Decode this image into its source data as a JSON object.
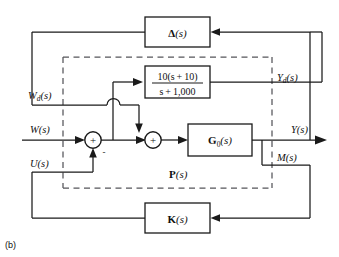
{
  "figure": {
    "caption": "(b)"
  },
  "blocks": [
    {
      "id": "delta",
      "name": "delta-block",
      "label_main": "Δ",
      "label_arg": "(s)"
    },
    {
      "id": "weight",
      "name": "weighting-filter-block",
      "numerator": "10(s + 10)",
      "denominator": "s + 1,000"
    },
    {
      "id": "g0",
      "name": "nominal-plant-block",
      "label_main": "G",
      "label_sub": "0",
      "label_arg": "(s)"
    },
    {
      "id": "k",
      "name": "controller-block",
      "label_main": "K",
      "label_arg": "(s)"
    }
  ],
  "signals": {
    "wd": {
      "base": "W",
      "sub": "d",
      "arg": "(s)"
    },
    "w": {
      "base": "W",
      "sub": "",
      "arg": "(s)"
    },
    "u": {
      "base": "U",
      "sub": "",
      "arg": "(s)"
    },
    "yd": {
      "base": "Y",
      "sub": "d",
      "arg": "(s)"
    },
    "y": {
      "base": "Y",
      "sub": "",
      "arg": "(s)"
    },
    "m": {
      "base": "M",
      "sub": "",
      "arg": "(s)"
    }
  },
  "plant_boundary": {
    "name": "plant-boundary",
    "label_main": "P",
    "label_arg": "(s)",
    "style": "dashed"
  },
  "summers": [
    {
      "id": "sum1",
      "name": "summing-junction-1",
      "inside": "+",
      "extra_sign": "-"
    },
    {
      "id": "sum2",
      "name": "summing-junction-2",
      "inside": "+",
      "extra_sign": ""
    }
  ],
  "colors": {
    "line": "#1a1a1a",
    "dashed": "#55555a",
    "background": "#ffffff",
    "text": "#111111"
  }
}
